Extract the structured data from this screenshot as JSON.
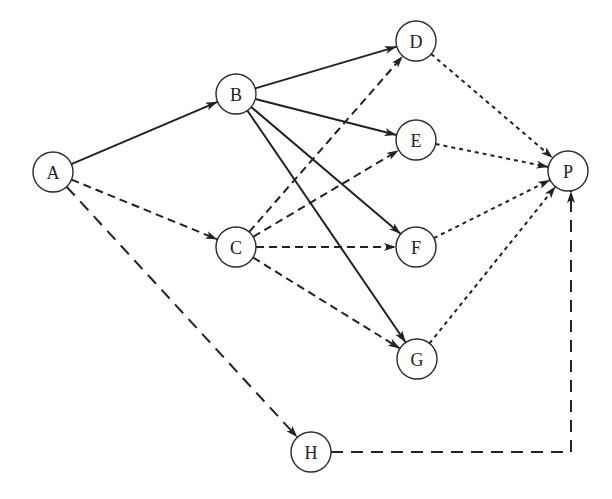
{
  "diagram": {
    "type": "directed-network",
    "colors": {
      "stroke": "#222222",
      "node_fill": "#ffffff",
      "background": "#ffffff"
    },
    "node_radius": 20,
    "nodes": [
      {
        "id": "A",
        "label": "A",
        "x": 53,
        "y": 172
      },
      {
        "id": "B",
        "label": "B",
        "x": 236,
        "y": 94
      },
      {
        "id": "C",
        "label": "C",
        "x": 236,
        "y": 247
      },
      {
        "id": "D",
        "label": "D",
        "x": 416,
        "y": 41
      },
      {
        "id": "E",
        "label": "E",
        "x": 416,
        "y": 140
      },
      {
        "id": "F",
        "label": "F",
        "x": 416,
        "y": 247
      },
      {
        "id": "G",
        "label": "G",
        "x": 417,
        "y": 359
      },
      {
        "id": "P",
        "label": "P",
        "x": 568,
        "y": 171
      },
      {
        "id": "H",
        "label": "H",
        "x": 311,
        "y": 452
      }
    ],
    "edges": [
      {
        "from": "A",
        "to": "B",
        "style": "solid"
      },
      {
        "from": "A",
        "to": "C",
        "style": "dashed"
      },
      {
        "from": "A",
        "to": "H",
        "style": "longdash"
      },
      {
        "from": "B",
        "to": "D",
        "style": "solid"
      },
      {
        "from": "B",
        "to": "E",
        "style": "solid"
      },
      {
        "from": "B",
        "to": "F",
        "style": "solid"
      },
      {
        "from": "B",
        "to": "G",
        "style": "solid"
      },
      {
        "from": "C",
        "to": "D",
        "style": "dashed"
      },
      {
        "from": "C",
        "to": "E",
        "style": "dashed"
      },
      {
        "from": "C",
        "to": "F",
        "style": "dashed"
      },
      {
        "from": "C",
        "to": "G",
        "style": "dashed"
      },
      {
        "from": "D",
        "to": "P",
        "style": "dotted"
      },
      {
        "from": "E",
        "to": "P",
        "style": "dotted"
      },
      {
        "from": "F",
        "to": "P",
        "style": "dotted"
      },
      {
        "from": "G",
        "to": "P",
        "style": "dotted"
      },
      {
        "from": "H",
        "to": "P",
        "style": "longdash",
        "route": "orthogonal",
        "corner": {
          "x": 571,
          "y": 452
        }
      }
    ]
  }
}
